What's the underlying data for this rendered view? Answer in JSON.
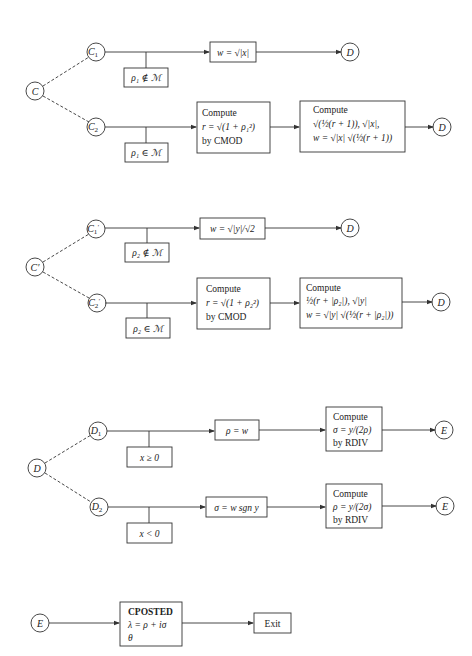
{
  "colors": {
    "line": "#333333",
    "background": "#ffffff"
  },
  "sections": [
    {
      "root": "C",
      "upper": {
        "node": "C",
        "sub": "1",
        "prime": "",
        "condition": "ρ₁ ∉ ℳ",
        "action": "w = √|x|",
        "target": "D"
      },
      "lower": {
        "node": "C",
        "sub": "2",
        "prime": "",
        "condition": "ρ₁ ∈ ℳ",
        "compute1": {
          "title": "Compute",
          "line1": "r = √(1 + ρ₁²)",
          "line2": "by CMOD"
        },
        "compute2": {
          "title": "Compute",
          "line1": "√(½(r + 1)), √|x|,",
          "line2": "w = √|x| √(½(r + 1))"
        },
        "target": "D"
      }
    },
    {
      "root": "C′",
      "upper": {
        "node": "C",
        "sub": "1",
        "prime": "′",
        "condition": "ρ₂ ∉ ℳ",
        "action": "w = √|y|/√2",
        "target": "D"
      },
      "lower": {
        "node": "C",
        "sub": "2",
        "prime": "′",
        "condition": "ρ₂ ∈ ℳ",
        "compute1": {
          "title": "Compute",
          "line1": "r = √(1 + ρ₂²)",
          "line2": "by CMOD"
        },
        "compute2": {
          "title": "Compute",
          "line1": "½(r + |ρ₂|), √|y|",
          "line2": "w = √|y| √(½(r + |ρ₂|))"
        },
        "target": "D"
      }
    },
    {
      "root": "D",
      "upper": {
        "node": "D",
        "sub": "1",
        "condition": "x ≥ 0",
        "action": "ρ = w",
        "compute": {
          "title": "Compute",
          "line1": "σ = y/(2ρ)",
          "line2": "by RDIV"
        },
        "target": "E"
      },
      "lower": {
        "node": "D",
        "sub": "2",
        "condition": "x < 0",
        "action": "σ = w sgn y",
        "compute": {
          "title": "Compute",
          "line1": "ρ = y/(2σ)",
          "line2": "by RDIV"
        },
        "target": "E"
      }
    },
    {
      "root": "E",
      "post": {
        "title": "CPOSTED",
        "line1": "λ = ρ + iσ",
        "line2": "θ"
      },
      "exit": "Exit"
    }
  ]
}
